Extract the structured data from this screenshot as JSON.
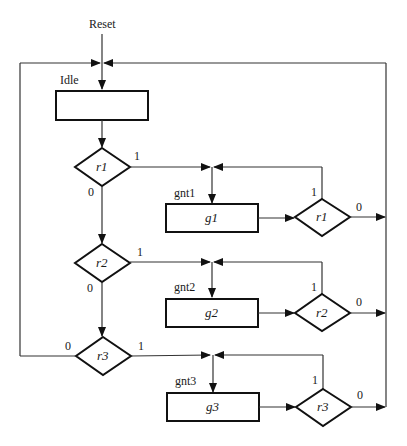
{
  "diagram": {
    "type": "ASM chart / arbiter flowchart",
    "reset_label": "Reset",
    "states": [
      {
        "name": "Idle",
        "box_text": ""
      },
      {
        "name": "gnt1",
        "box_text": "g1"
      },
      {
        "name": "gnt2",
        "box_text": "g2"
      },
      {
        "name": "gnt3",
        "box_text": "g3"
      }
    ],
    "decisions_left": [
      {
        "cond": "r1",
        "true_label": "1",
        "false_label": "0"
      },
      {
        "cond": "r2",
        "true_label": "1",
        "false_label": "0"
      },
      {
        "cond": "r3",
        "true_label": "1",
        "false_label": "0"
      }
    ],
    "decisions_right": [
      {
        "cond": "r1",
        "true_label": "1",
        "false_label": "0"
      },
      {
        "cond": "r2",
        "true_label": "1",
        "false_label": "0"
      },
      {
        "cond": "r3",
        "true_label": "1",
        "false_label": "0"
      }
    ]
  }
}
